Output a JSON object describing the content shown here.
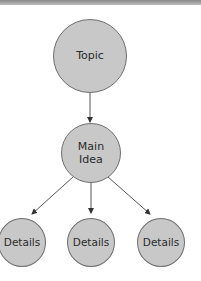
{
  "colors": {
    "node_fill": "#c8c8c8",
    "node_border": "#6e6e6e",
    "arrow": "#444444",
    "text": "#2a2a2a",
    "top_band": "#9a9a9a"
  },
  "diagram": {
    "topic": {
      "label": "Topic"
    },
    "main_idea": {
      "label": "Main\nIdea"
    },
    "details": [
      {
        "label": "Details"
      },
      {
        "label": "Details"
      },
      {
        "label": "Details"
      }
    ],
    "edges": [
      {
        "from": "Topic",
        "to": "Main Idea"
      },
      {
        "from": "Main Idea",
        "to": "Details 1"
      },
      {
        "from": "Main Idea",
        "to": "Details 2"
      },
      {
        "from": "Main Idea",
        "to": "Details 3"
      }
    ]
  }
}
